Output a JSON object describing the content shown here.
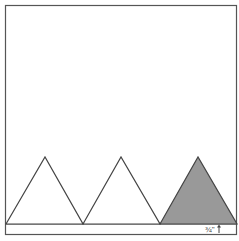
{
  "diagram": {
    "outer_box": {
      "x": 5,
      "y": 5,
      "width": 232,
      "height": 230,
      "stroke": "#555555"
    },
    "base_strip": {
      "y_top": 224,
      "y_bottom": 235
    },
    "triangles": [
      {
        "name": "triangle-1",
        "left": 6,
        "apex_x": 45,
        "right": 83,
        "apex_y": 157,
        "base_y": 224,
        "fill": "#ffffff"
      },
      {
        "name": "triangle-2",
        "left": 83,
        "apex_x": 121,
        "right": 160,
        "apex_y": 157,
        "base_y": 224,
        "fill": "#ffffff"
      },
      {
        "name": "triangle-3",
        "left": 160,
        "apex_x": 198,
        "right": 237,
        "apex_y": 157,
        "base_y": 224,
        "fill": "#999999"
      }
    ],
    "measurement_label": "¾\"",
    "measurement_arrow": "up-arrow"
  }
}
